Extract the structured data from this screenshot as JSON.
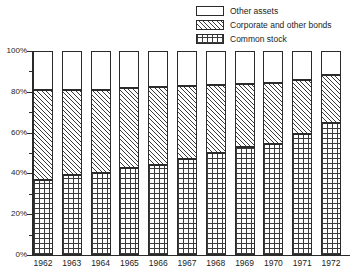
{
  "chart_data": {
    "type": "bar",
    "stacked": true,
    "stack_mode": "percent",
    "title": "",
    "subtitle": "",
    "xlabel": "",
    "ylabel": "",
    "ylim": [
      0,
      100
    ],
    "ytick_labels": [
      "0%",
      "20%",
      "40%",
      "60%",
      "80%",
      "100%"
    ],
    "ytick_values": [
      0,
      20,
      40,
      60,
      80,
      100
    ],
    "yminor_values": [
      10,
      30,
      50,
      70,
      90
    ],
    "grid": false,
    "legend_position": "top-right",
    "categories": [
      "1962",
      "1963",
      "1964",
      "1965",
      "1966",
      "1967",
      "1968",
      "1969",
      "1970",
      "1971",
      "1972"
    ],
    "series": [
      {
        "name": "Common stock",
        "pattern": "grid",
        "color": "#ffffff",
        "values": [
          37.0,
          39.0,
          40.0,
          42.5,
          44.0,
          47.0,
          50.0,
          53.0,
          54.5,
          59.5,
          64.5
        ]
      },
      {
        "name": "Corporate and other bonds",
        "pattern": "diagonal",
        "color": "#ffffff",
        "values": [
          44.0,
          42.0,
          41.0,
          39.5,
          38.5,
          36.0,
          33.5,
          31.0,
          30.0,
          26.5,
          23.5
        ]
      },
      {
        "name": "Other assets",
        "pattern": "plain",
        "color": "#ffffff",
        "values": [
          19.0,
          19.0,
          19.0,
          18.0,
          17.5,
          17.0,
          16.5,
          16.0,
          15.5,
          14.0,
          12.0
        ]
      }
    ],
    "cumulative_tops": {
      "common_stock": [
        37.0,
        39.0,
        40.0,
        42.5,
        44.0,
        47.0,
        50.0,
        53.0,
        54.5,
        59.5,
        64.5
      ],
      "bonds": [
        81.0,
        81.0,
        81.0,
        82.0,
        82.5,
        83.0,
        83.5,
        84.0,
        84.5,
        86.0,
        88.0
      ],
      "other_assets": [
        100,
        100,
        100,
        100,
        100,
        100,
        100,
        100,
        100,
        100,
        100
      ]
    }
  },
  "legend": {
    "items": [
      {
        "label": "Other assets",
        "pattern": "plain"
      },
      {
        "label": "Corporate and other bonds",
        "pattern": "diagonal"
      },
      {
        "label": "Common stock",
        "pattern": "grid"
      }
    ]
  },
  "axis": {
    "y_labels": [
      "100%",
      "80%",
      "60%",
      "40%",
      "20%",
      "0%"
    ],
    "x_labels": [
      "1962",
      "1963",
      "1964",
      "1965",
      "1966",
      "1967",
      "1968",
      "1969",
      "1970",
      "1971",
      "1972"
    ]
  },
  "colors": {
    "ink": "#2a2a2a",
    "background": "#ffffff",
    "hatch": "#3a3a3a"
  }
}
